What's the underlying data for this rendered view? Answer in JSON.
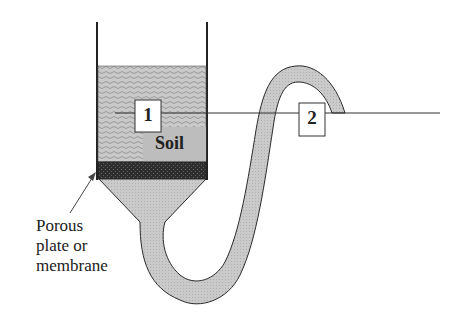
{
  "diagram": {
    "type": "tension-infiltrometer / soil water potential apparatus",
    "labels": {
      "soil": "Soil",
      "point1": "1",
      "point2": "2",
      "plate_line1": "Porous",
      "plate_line2": "plate or",
      "plate_line3": "membrane"
    },
    "colors": {
      "soil_fill": "#bdbdbd",
      "plate_fill": "#3a3a3a",
      "water_fill": "#c4c4c4",
      "stroke": "#2b2b2b",
      "background": "#ffffff"
    }
  }
}
